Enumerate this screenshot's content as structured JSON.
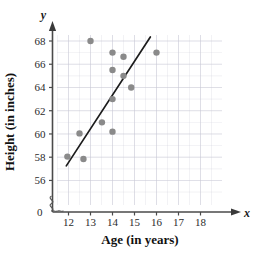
{
  "chart_data": {
    "type": "scatter",
    "title": "",
    "xlabel": "Age (in years)",
    "ylabel": "Height (in inches)",
    "x_axis_symbol": "x",
    "y_axis_symbol": "y",
    "origin_label": "0",
    "xlim": [
      11.5,
      18.8
    ],
    "ylim": [
      55.0,
      68.8
    ],
    "xticks": [
      12,
      13,
      14,
      15,
      16,
      17,
      18
    ],
    "yticks": [
      56,
      58,
      60,
      62,
      64,
      66,
      68
    ],
    "xtick_labels": [
      "12",
      "13",
      "14",
      "15",
      "16",
      "17",
      "18"
    ],
    "ytick_labels": [
      "56",
      "58",
      "60",
      "62",
      "64",
      "66",
      "68"
    ],
    "grid": true,
    "grid_minor": true,
    "grid_color": "#c9c9d6",
    "axis_break": true,
    "point_color": "#8a8a8a",
    "point_radius": 3.2,
    "line_color": "#1c1c1c",
    "points": [
      {
        "x": 11.95,
        "y": 58.05
      },
      {
        "x": 12.5,
        "y": 60.05
      },
      {
        "x": 12.68,
        "y": 57.85
      },
      {
        "x": 13.0,
        "y": 68.0
      },
      {
        "x": 13.52,
        "y": 61.0
      },
      {
        "x": 14.0,
        "y": 67.0
      },
      {
        "x": 14.0,
        "y": 65.5
      },
      {
        "x": 14.0,
        "y": 63.0
      },
      {
        "x": 14.0,
        "y": 60.2
      },
      {
        "x": 14.5,
        "y": 66.65
      },
      {
        "x": 14.5,
        "y": 65.0
      },
      {
        "x": 14.85,
        "y": 64.0
      },
      {
        "x": 16.0,
        "y": 67.0
      }
    ],
    "trend_line": {
      "x1": 11.9,
      "y1": 57.25,
      "x2": 15.72,
      "y2": 68.35
    },
    "series": [
      {
        "name": "Age vs Height",
        "x": [
          11.95,
          12.5,
          12.68,
          13.0,
          13.52,
          14.0,
          14.0,
          14.0,
          14.0,
          14.5,
          14.5,
          14.85,
          16.0
        ],
        "y": [
          58.05,
          60.05,
          57.85,
          68.0,
          61.0,
          67.0,
          65.5,
          63.0,
          60.2,
          66.65,
          65.0,
          64.0,
          67.0
        ]
      }
    ]
  }
}
